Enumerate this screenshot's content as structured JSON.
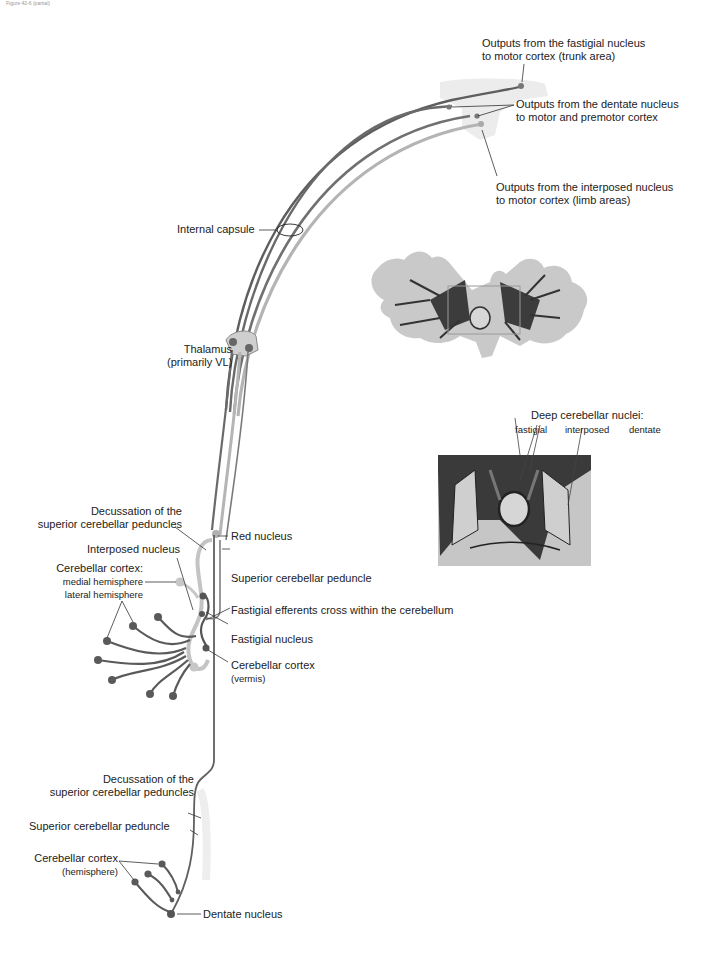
{
  "figure": {
    "caption": "Figure 42-6 (partial)"
  },
  "labels": {
    "fastigial_output": [
      "Outputs from the fastigial nucleus",
      "to motor cortex (trunk area)"
    ],
    "dentate_output": [
      "Outputs from the dentate nucleus",
      "to motor and premotor cortex"
    ],
    "interposed_output": [
      "Outputs from the interposed nucleus",
      "to motor cortex (limb areas)"
    ],
    "internal_capsule": "Internal capsule",
    "thalamus": [
      "Thalamus",
      "(primarily VL)"
    ],
    "deep_nuclei_title": "Deep cerebellar nuclei:",
    "deep_nuclei": [
      "fastigial",
      "interposed",
      "dentate"
    ],
    "decussation_upper": [
      "Decussation of the",
      "superior cerebellar peduncles"
    ],
    "red_nucleus": "Red nucleus",
    "interposed_nucleus": "Interposed nucleus",
    "cerebellar_cortex_upper": [
      "Cerebellar cortex:",
      "medial hemisphere",
      "lateral hemisphere"
    ],
    "superior_peduncle_upper": "Superior cerebellar peduncle",
    "fastigial_efferents": "Fastigial efferents cross within the cerebellum",
    "fastigial_nucleus": "Fastigial nucleus",
    "cerebellar_cortex_vermis": [
      "Cerebellar cortex",
      "(vermis)"
    ],
    "decussation_lower": [
      "Decussation of the",
      "superior cerebellar peduncles"
    ],
    "superior_peduncle_lower": "Superior cerebellar peduncle",
    "cerebellar_cortex_hemisphere": [
      "Cerebellar cortex",
      "(hemisphere)"
    ],
    "dentate_nucleus": "Dentate nucleus"
  },
  "colors": {
    "pathway_dark": "#5a5a5a",
    "pathway_mid": "#8a8a8a",
    "pathway_light": "#b8b8b8",
    "cortex_patch": "#ececec",
    "leader": "#333333"
  }
}
